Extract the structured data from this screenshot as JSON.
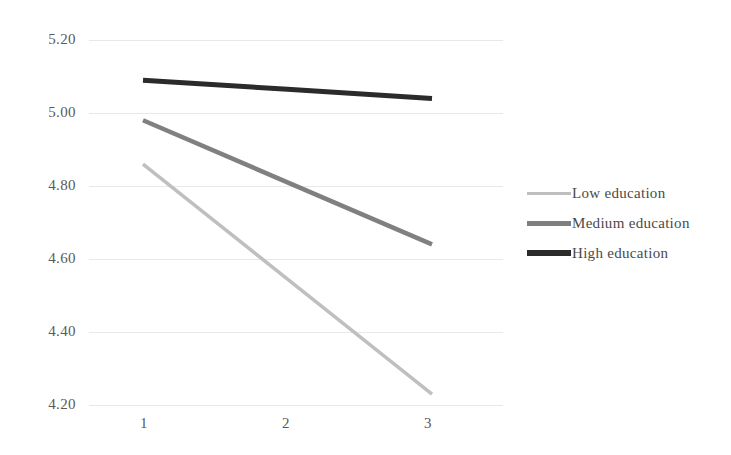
{
  "chart_data": {
    "type": "line",
    "title": "",
    "subtitle": "",
    "xlabel": "",
    "ylabel": "",
    "x": [
      1,
      2,
      3
    ],
    "xtick_labels": [
      "1",
      "2",
      "3"
    ],
    "ytick_labels": [
      "5.20",
      "5.00",
      "4.80",
      "4.60",
      "4.40",
      "4.20"
    ],
    "ytick_values": [
      5.2,
      5.0,
      4.8,
      4.6,
      4.4,
      4.2
    ],
    "ylim": [
      4.2,
      5.2
    ],
    "xlim": [
      1,
      3
    ],
    "grid": "horizontal",
    "legend_position": "right",
    "series": [
      {
        "name": "Low education",
        "color": "#BFBFBF",
        "values": [
          4.86,
          4.545,
          4.23
        ]
      },
      {
        "name": "Medium education",
        "color": "#808080",
        "values": [
          4.98,
          4.81,
          4.64
        ]
      },
      {
        "name": "High education",
        "color": "#2B2B2B",
        "values": [
          5.09,
          5.065,
          5.04
        ]
      }
    ]
  },
  "axes": {
    "y_ticks": [
      {
        "label": "5.20",
        "top": 31
      },
      {
        "label": "5.00",
        "top": 104
      },
      {
        "label": "4.80",
        "top": 177
      },
      {
        "label": "4.60",
        "top": 250
      },
      {
        "label": "4.40",
        "top": 323
      },
      {
        "label": "4.20",
        "top": 396
      }
    ],
    "x_ticks": [
      {
        "label": "1",
        "left": 124
      },
      {
        "label": "2",
        "left": 266
      },
      {
        "label": "3",
        "left": 408
      }
    ]
  },
  "legend": {
    "items": [
      {
        "label": "Low education",
        "color": "#BFBFBF",
        "thickness": 3
      },
      {
        "label": "Medium education",
        "color": "#7F7F7F",
        "thickness": 5
      },
      {
        "label": "High education",
        "color": "#2B2B2B",
        "thickness": 6
      }
    ]
  },
  "style": {
    "background": "#FFFFFF",
    "gridline_color": "#E8E8E8",
    "tick_text_color": "#5A5A5A"
  }
}
